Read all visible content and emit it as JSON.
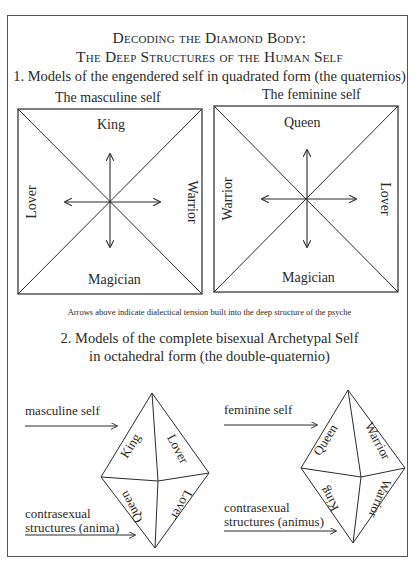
{
  "title": {
    "line1": "Decoding the Diamond Body:",
    "line2": "The Deep Structures of the Human Self"
  },
  "section1": {
    "heading": "1. Models of the engendered self in quadrated form (the quaternios)",
    "masculine": {
      "title": "The masculine self",
      "top": "King",
      "left": "Lover",
      "right": "Warrior",
      "bottom": "Magician"
    },
    "feminine": {
      "title": "The feminine self",
      "top": "Queen",
      "left": "Warrior",
      "right": "Lover",
      "bottom": "Magician"
    },
    "caption": "Arrows above indicate dialectical tension built into the deep structure of the psyche"
  },
  "section2": {
    "heading_line1": "2. Models of the complete bisexual Archetypal Self",
    "heading_line2": "in octahedral form (the double-quaternio)",
    "masculine": {
      "upper_label": "masculine self",
      "lower_label_line1": "contrasexual",
      "lower_label_line2": "structures (anima)",
      "face_upper_left": "King",
      "face_upper_right": "Lover",
      "face_lower_left": "Queen",
      "face_lower_right": "Lover"
    },
    "feminine": {
      "upper_label": "feminine self",
      "lower_label_line1": "contrasexual",
      "lower_label_line2": "structures (animus)",
      "face_upper_left": "Queen",
      "face_upper_right": "Warrior",
      "face_lower_left": "King",
      "face_lower_right": "Warrior"
    }
  },
  "colors": {
    "ink": "#2a2a2a",
    "frame": "#555555",
    "background": "#ffffff"
  }
}
